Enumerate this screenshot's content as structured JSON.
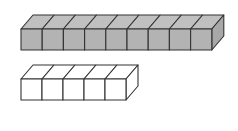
{
  "diagram": {
    "rows": [
      {
        "name": "gray-cube-row",
        "count": 9,
        "fill": "#b3b3b3",
        "top_fill": "#c0c0c0",
        "side_fill": "#a8a8a8",
        "x": 21,
        "y": 29,
        "cube_w": 21.2,
        "cube_h": 21,
        "dx": 12,
        "dy": 14
      },
      {
        "name": "white-cube-row",
        "count": 5,
        "fill": "#ffffff",
        "top_fill": "#ffffff",
        "side_fill": "#ffffff",
        "x": 21,
        "y": 79,
        "cube_w": 21,
        "cube_h": 21,
        "dx": 12,
        "dy": 14
      }
    ],
    "stroke": "#333333"
  }
}
